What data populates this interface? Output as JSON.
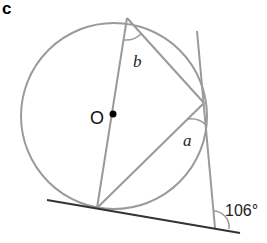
{
  "figure": {
    "part_label": "c",
    "center_label": "O",
    "angle_labels": {
      "b": "b",
      "a": "a",
      "given": "106°"
    },
    "colors": {
      "circle": "#9a9a9a",
      "chords": "#9a9a9a",
      "tangent": "#333333",
      "secant": "#9a9a9a",
      "dot": "#000000"
    }
  }
}
